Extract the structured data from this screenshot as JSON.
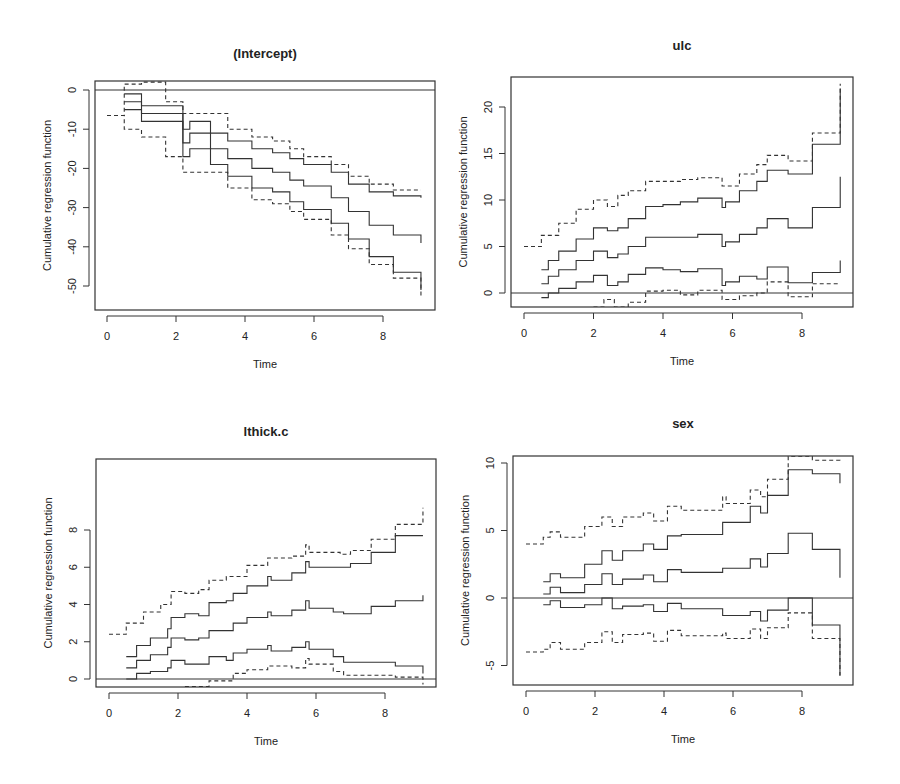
{
  "figure": {
    "layout": "2x2 grid",
    "shared_xlabel": "Time",
    "shared_ylabel": "Cumulative regression function"
  },
  "chart_data": [
    {
      "type": "line",
      "title": "(Intercept)",
      "xlabel": "Time",
      "ylabel": "Cumulative regression function",
      "xlim": [
        0,
        9.2
      ],
      "ylim": [
        -55,
        3
      ],
      "xticks": [
        0,
        2,
        4,
        6,
        8
      ],
      "yticks": [
        0,
        -10,
        -20,
        -30,
        -40,
        -50
      ],
      "grid": false,
      "legend": "none",
      "reference_line": 0,
      "series": [
        {
          "name": "upper band",
          "style": "dashed",
          "x": [
            0,
            0.5,
            1.0,
            1.7,
            2.2,
            2.6,
            3.5,
            4.2,
            4.8,
            5.3,
            5.7,
            6.5,
            7.0,
            7.6,
            8.3,
            9.1
          ],
          "y": [
            -6.5,
            1.5,
            2,
            -3,
            -6,
            -6,
            -10,
            -12,
            -13,
            -15,
            -17,
            -19,
            -22,
            -24,
            -25.5,
            -25.5
          ]
        },
        {
          "name": "upper CI",
          "style": "solid",
          "x": [
            0.5,
            1.0,
            2.2,
            2.4,
            3.0,
            3.5,
            4.2,
            4.8,
            5.3,
            5.7,
            6.5,
            7.0,
            7.6,
            8.3,
            9.1
          ],
          "y": [
            -1,
            -4,
            -10,
            -8,
            -11,
            -13,
            -15,
            -16,
            -17.5,
            -19,
            -21,
            -24,
            -26,
            -27,
            -27.5
          ]
        },
        {
          "name": "estimate",
          "style": "solid",
          "x": [
            0.5,
            1.0,
            2.2,
            2.4,
            3.0,
            3.5,
            4.2,
            4.8,
            5.3,
            5.7,
            6.5,
            7.0,
            7.6,
            8.3,
            9.1
          ],
          "y": [
            -3,
            -6,
            -13.5,
            -11,
            -15,
            -17.5,
            -20,
            -21,
            -23,
            -24.5,
            -27.5,
            -31,
            -34.5,
            -37,
            -39
          ]
        },
        {
          "name": "lower CI",
          "style": "solid",
          "x": [
            0.5,
            1.0,
            2.2,
            2.4,
            3.0,
            3.5,
            4.2,
            4.8,
            5.3,
            5.7,
            6.5,
            7.0,
            7.6,
            8.3,
            9.1
          ],
          "y": [
            -5,
            -8,
            -17,
            -15,
            -19,
            -22,
            -25,
            -26,
            -28.5,
            -30.5,
            -34,
            -38,
            -42.5,
            -46.5,
            -51
          ]
        },
        {
          "name": "lower band",
          "style": "dashed",
          "x": [
            0,
            0.5,
            1.0,
            1.7,
            2.2,
            2.6,
            3.5,
            4.2,
            4.8,
            5.3,
            5.7,
            6.5,
            7.0,
            7.6,
            8.3,
            9.1
          ],
          "y": [
            -6.5,
            -10,
            -12,
            -17,
            -21,
            -21,
            -25,
            -28,
            -29,
            -31,
            -33,
            -37,
            -40.5,
            -44.5,
            -48,
            -53
          ]
        }
      ]
    },
    {
      "type": "line",
      "title": "ulc",
      "xlabel": "Time",
      "ylabel": "Cumulative regression function",
      "xlim": [
        0,
        9.2
      ],
      "ylim": [
        -1.5,
        23
      ],
      "xticks": [
        0,
        2,
        4,
        6,
        8
      ],
      "yticks": [
        0,
        5,
        10,
        15,
        20
      ],
      "grid": false,
      "legend": "none",
      "reference_line": 0,
      "series": [
        {
          "name": "upper band",
          "style": "dashed",
          "x": [
            0,
            0.5,
            1.0,
            1.5,
            2.0,
            2.4,
            2.7,
            3.0,
            3.5,
            4.0,
            4.5,
            5.0,
            5.7,
            6.2,
            6.7,
            7.0,
            7.6,
            8.3,
            9.1
          ],
          "y": [
            5,
            6.2,
            7.5,
            9,
            10,
            9.3,
            10.5,
            11,
            12,
            12,
            12.2,
            12.4,
            11.5,
            12.8,
            13.8,
            14.8,
            14.2,
            17.2,
            22.5
          ]
        },
        {
          "name": "upper CI",
          "style": "solid",
          "x": [
            0.5,
            0.7,
            1.0,
            1.5,
            2.0,
            2.4,
            2.7,
            3.0,
            3.5,
            4.0,
            4.5,
            5.0,
            5.7,
            5.8,
            6.2,
            6.7,
            7.0,
            7.6,
            8.3,
            9.1
          ],
          "y": [
            2.5,
            3.5,
            4.5,
            5.8,
            7,
            6.7,
            7,
            8,
            9.3,
            9.5,
            9.8,
            10.2,
            9.2,
            9.8,
            11,
            12,
            13.2,
            12.8,
            16,
            22
          ]
        },
        {
          "name": "estimate",
          "style": "solid",
          "x": [
            0.5,
            0.7,
            1.0,
            1.5,
            2.0,
            2.4,
            2.7,
            3.0,
            3.5,
            4.0,
            4.5,
            5.0,
            5.7,
            5.8,
            6.2,
            6.7,
            7.0,
            7.6,
            8.3,
            9.1
          ],
          "y": [
            1,
            1.8,
            2.5,
            3.5,
            4.5,
            3.8,
            4.2,
            5,
            6,
            6,
            6,
            6.3,
            5,
            5.5,
            6.3,
            7,
            8,
            7,
            9.2,
            12.5
          ]
        },
        {
          "name": "lower CI",
          "style": "solid",
          "x": [
            0.5,
            0.7,
            1.0,
            1.5,
            2.0,
            2.4,
            2.7,
            3.0,
            3.5,
            4.0,
            4.5,
            5.0,
            5.7,
            5.8,
            6.2,
            6.7,
            7.0,
            7.6,
            8.3,
            9.1
          ],
          "y": [
            -0.5,
            0,
            0.5,
            1.2,
            1.9,
            0.8,
            1.2,
            2,
            2.7,
            2.5,
            2.3,
            2.6,
            0.8,
            1.2,
            1.8,
            1.5,
            2.8,
            1.1,
            2.2,
            3.5
          ]
        },
        {
          "name": "lower band",
          "style": "dashed",
          "x": [
            2.0,
            2.3,
            2.6,
            3.0,
            3.5,
            4.0,
            4.5,
            5.0,
            5.7,
            6.2,
            6.7,
            7.0,
            7.6,
            8.3,
            9.1
          ],
          "y": [
            -1.5,
            -0.7,
            -1.5,
            -1,
            0.2,
            0.3,
            -0.2,
            0.3,
            -0.7,
            -0.3,
            0,
            1.2,
            -0.4,
            1,
            1
          ]
        }
      ]
    },
    {
      "type": "line",
      "title": "lthick.c",
      "xlabel": "Time",
      "ylabel": "Cumulative regression function",
      "xlim": [
        0,
        9.2
      ],
      "ylim": [
        -0.4,
        9.3
      ],
      "xticks": [
        0,
        2,
        4,
        6,
        8
      ],
      "yticks": [
        0,
        2,
        4,
        6,
        8
      ],
      "grid": false,
      "legend": "none",
      "reference_line": 0,
      "series": [
        {
          "name": "upper band",
          "style": "dashed",
          "x": [
            0,
            0.5,
            1.0,
            1.5,
            1.8,
            2.2,
            2.6,
            2.9,
            3.4,
            4.0,
            4.6,
            5.3,
            5.7,
            5.8,
            6.7,
            7.0,
            7.6,
            8.3,
            9.1
          ],
          "y": [
            2.4,
            3.0,
            3.6,
            4.0,
            4.7,
            4.6,
            4.8,
            5.3,
            5.5,
            6.1,
            6.5,
            6.6,
            7.2,
            6.8,
            6.7,
            6.9,
            7.5,
            8.3,
            9.2
          ]
        },
        {
          "name": "upper CI",
          "style": "solid",
          "x": [
            0.5,
            0.8,
            1.2,
            1.7,
            1.8,
            2.2,
            2.6,
            2.9,
            3.4,
            3.6,
            4.0,
            4.6,
            4.7,
            5.3,
            5.7,
            5.8,
            6.5,
            7.0,
            7.6,
            8.3,
            9.1
          ],
          "y": [
            1.2,
            1.8,
            2.2,
            2.7,
            3.3,
            3.5,
            3.4,
            4.1,
            4.2,
            4.6,
            5.0,
            5.5,
            5.3,
            5.7,
            6.3,
            6.0,
            6.0,
            6.2,
            6.8,
            7.7,
            7.7
          ]
        },
        {
          "name": "estimate",
          "style": "solid",
          "x": [
            0.5,
            0.8,
            1.2,
            1.7,
            1.8,
            2.2,
            2.6,
            2.9,
            3.4,
            3.6,
            4.0,
            4.6,
            4.7,
            5.3,
            5.7,
            5.8,
            6.5,
            6.8,
            7.6,
            8.3,
            9.1
          ],
          "y": [
            0.6,
            1.0,
            1.3,
            1.7,
            2.2,
            2.1,
            2.2,
            2.6,
            2.6,
            3.0,
            3.3,
            3.6,
            3.4,
            3.7,
            4.2,
            3.8,
            3.6,
            3.5,
            3.9,
            4.2,
            4.5
          ]
        },
        {
          "name": "lower CI",
          "style": "solid",
          "x": [
            0.5,
            0.8,
            1.2,
            1.7,
            1.8,
            2.2,
            2.6,
            2.9,
            3.4,
            3.6,
            4.0,
            4.6,
            4.7,
            5.3,
            5.7,
            5.8,
            6.5,
            6.8,
            7.6,
            8.3,
            9.1
          ],
          "y": [
            0,
            0.3,
            0.4,
            0.6,
            1.0,
            0.8,
            0.8,
            1.2,
            1.0,
            1.4,
            1.6,
            1.8,
            1.5,
            1.7,
            2.0,
            1.6,
            1.2,
            0.9,
            0.9,
            0.7,
            0.3
          ]
        },
        {
          "name": "lower band",
          "style": "dashed",
          "x": [
            2.2,
            2.9,
            3.6,
            4.0,
            4.6,
            5.3,
            5.7,
            5.8,
            6.5,
            6.8,
            7.6,
            8.3,
            9.1
          ],
          "y": [
            -0.4,
            -0.1,
            0.3,
            0.5,
            0.7,
            0.6,
            1.1,
            0.8,
            0.4,
            0.2,
            0.2,
            0.1,
            -0.3
          ]
        }
      ]
    },
    {
      "type": "line",
      "title": "sex",
      "xlabel": "Time",
      "ylabel": "Cumulative regression function",
      "xlim": [
        0,
        9.2
      ],
      "ylim": [
        -6.5,
        10.5
      ],
      "xticks": [
        0,
        2,
        4,
        6,
        8
      ],
      "yticks": [
        -5,
        0,
        5,
        10
      ],
      "grid": false,
      "legend": "none",
      "reference_line": 0,
      "series": [
        {
          "name": "upper band",
          "style": "dashed",
          "x": [
            0,
            0.5,
            0.7,
            1.0,
            1.7,
            2.2,
            2.5,
            2.8,
            3.4,
            3.7,
            4.1,
            4.5,
            5.7,
            5.8,
            6.5,
            6.8,
            7.0,
            7.6,
            8.3,
            9.1
          ],
          "y": [
            4,
            4.5,
            4.9,
            4.5,
            5.3,
            6.0,
            5.3,
            6.0,
            6.3,
            5.7,
            6.8,
            6.5,
            7.5,
            7.0,
            8.0,
            7.5,
            8.8,
            10.5,
            10.2,
            10
          ]
        },
        {
          "name": "upper CI",
          "style": "solid",
          "x": [
            0.5,
            0.7,
            1.0,
            1.7,
            2.2,
            2.5,
            2.8,
            3.4,
            3.7,
            4.1,
            4.5,
            5.7,
            5.8,
            6.5,
            6.8,
            7.0,
            7.6,
            8.3,
            9.1
          ],
          "y": [
            1.2,
            1.8,
            1.5,
            2.5,
            3.5,
            2.8,
            3.5,
            4.0,
            3.6,
            4.6,
            4.7,
            5.6,
            5.6,
            6.8,
            6.3,
            7.6,
            9.5,
            9.2,
            8.5
          ]
        },
        {
          "name": "estimate",
          "style": "solid",
          "x": [
            0.5,
            0.7,
            1.0,
            1.7,
            2.2,
            2.5,
            2.8,
            3.4,
            3.7,
            4.1,
            4.5,
            5.7,
            5.8,
            6.5,
            6.8,
            7.0,
            7.6,
            8.3,
            9.1
          ],
          "y": [
            0.3,
            0.8,
            0.4,
            1.0,
            1.8,
            1.0,
            1.4,
            1.7,
            1.2,
            2.1,
            1.9,
            2.2,
            2.2,
            2.9,
            2.3,
            3.3,
            4.8,
            3.6,
            1.5
          ]
        },
        {
          "name": "lower CI",
          "style": "solid",
          "x": [
            0.5,
            0.7,
            1.0,
            1.7,
            2.2,
            2.5,
            2.8,
            3.4,
            3.7,
            4.1,
            4.5,
            5.7,
            5.8,
            6.5,
            6.8,
            7.0,
            7.6,
            8.3,
            9.1
          ],
          "y": [
            -0.5,
            -0.2,
            -0.7,
            -0.5,
            0,
            -0.8,
            -0.6,
            -0.5,
            -1.0,
            -0.4,
            -0.8,
            -1.3,
            -1.3,
            -1.0,
            -1.7,
            -0.9,
            0,
            -2.0,
            -5.7
          ]
        },
        {
          "name": "lower band",
          "style": "dashed",
          "x": [
            0,
            0.5,
            0.7,
            1.0,
            1.7,
            2.2,
            2.5,
            2.8,
            3.4,
            3.7,
            4.1,
            4.5,
            5.7,
            5.8,
            6.5,
            6.8,
            7.0,
            7.6,
            8.3,
            9.1
          ],
          "y": [
            -4,
            -3.8,
            -3.3,
            -3.8,
            -3.3,
            -2.5,
            -3.3,
            -2.7,
            -2.6,
            -3.2,
            -2.4,
            -2.8,
            -2.6,
            -3.0,
            -2.3,
            -3.0,
            -2.2,
            -1.1,
            -3.0,
            -6.0
          ]
        }
      ]
    }
  ]
}
